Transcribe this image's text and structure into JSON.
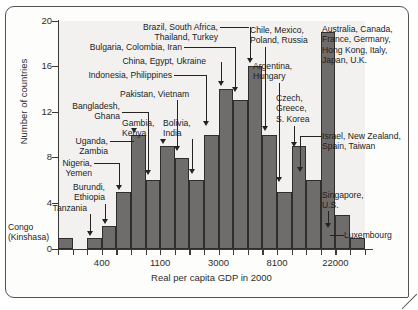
{
  "chart_data": {
    "type": "bar",
    "title": "",
    "xlabel": "Real per capita GDP in 2000",
    "ylabel": "Number of countries",
    "ylim": [
      0,
      20
    ],
    "yticks": [
      0,
      4,
      8,
      12,
      16,
      20
    ],
    "xticks": [
      "400",
      "1100",
      "3000",
      "8100",
      "22000"
    ],
    "grid": false,
    "legend": "none",
    "categories": [
      "1",
      "2",
      "3",
      "4",
      "5",
      "6",
      "7",
      "8",
      "9",
      "10",
      "11",
      "12",
      "13",
      "14",
      "15",
      "16",
      "17",
      "18",
      "19",
      "20",
      "21"
    ],
    "values": [
      1,
      0,
      1,
      2,
      5,
      10,
      6,
      9,
      8,
      6,
      10,
      14,
      13,
      16,
      10,
      5,
      9,
      6,
      19,
      3,
      1
    ],
    "bar_color": "#6f6d6b",
    "panel_color": "#f2f1ef"
  },
  "axes": {
    "y_label": "Number of countries",
    "x_label": "Real per capita GDP in 2000",
    "y_ticks": [
      {
        "value": 20,
        "label": "20"
      },
      {
        "value": 16,
        "label": "16"
      },
      {
        "value": 12,
        "label": "12"
      },
      {
        "value": 8,
        "label": "8"
      },
      {
        "value": 4,
        "label": "4"
      },
      {
        "value": 0,
        "label": "0"
      }
    ],
    "x_ticks": [
      {
        "label": "400"
      },
      {
        "label": "1100"
      },
      {
        "label": "3000"
      },
      {
        "label": "8100"
      },
      {
        "label": "22000"
      }
    ]
  },
  "annotations": [
    {
      "id": "congo",
      "text": "Congo\n(Kinshasa)"
    },
    {
      "id": "tanzania",
      "text": "Tanzania"
    },
    {
      "id": "burundi",
      "text": "Burundi,\nEthiopia"
    },
    {
      "id": "nigeria",
      "text": "Nigeria,\nYemen"
    },
    {
      "id": "uganda",
      "text": "Uganda,\nZambia"
    },
    {
      "id": "bangladesh",
      "text": "Bangladesh,\nGhana"
    },
    {
      "id": "gambia",
      "text": "Gambia,\nKenya"
    },
    {
      "id": "pakistan",
      "text": "Pakistan, Vietnam"
    },
    {
      "id": "bolivia",
      "text": "Bolivia,\nIndia"
    },
    {
      "id": "indonesia",
      "text": "Indonesia, Philippines"
    },
    {
      "id": "china",
      "text": "China, Egypt, Ukraine"
    },
    {
      "id": "bulgaria",
      "text": "Bulgaria, Colombia, Iran"
    },
    {
      "id": "brazil",
      "text": "Brazil, South Africa,\nThailand, Turkey"
    },
    {
      "id": "chile",
      "text": "Chile, Mexico,\nPoland, Russia"
    },
    {
      "id": "argentina",
      "text": "Argentina,\nHungary"
    },
    {
      "id": "czech",
      "text": "Czech,\nGreece,\nS. Korea"
    },
    {
      "id": "australia",
      "text": "Australia, Canada,\nFrance, Germany,\nHong Kong, Italy,\nJapan, U.K."
    },
    {
      "id": "israel",
      "text": "Israel, New Zealand,\nSpain, Taiwan"
    },
    {
      "id": "singapore",
      "text": "Singapore,\nU.S."
    },
    {
      "id": "luxembourg",
      "text": "Luxembourg"
    }
  ]
}
